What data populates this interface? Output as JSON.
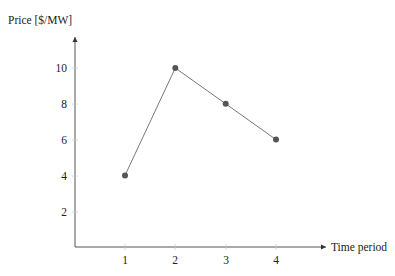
{
  "chart_data": {
    "type": "line",
    "title": "",
    "xlabel": "Time period",
    "ylabel": "Price [$/MW]",
    "x": [
      1,
      2,
      3,
      4
    ],
    "values": [
      4,
      10,
      8,
      6
    ],
    "series": [
      {
        "name": "Price",
        "x": [
          1,
          2,
          3,
          4
        ],
        "values": [
          4,
          10,
          8,
          6
        ],
        "color": "#555555",
        "marker": "filled-circle"
      }
    ],
    "x_ticks": [
      1,
      2,
      3,
      4
    ],
    "y_ticks": [
      2,
      4,
      6,
      8,
      10
    ],
    "xlim": [
      0,
      5
    ],
    "ylim": [
      0,
      11.5
    ],
    "grid": false,
    "legend": "none"
  },
  "labels": {
    "ylabel": "Price [$/MW]",
    "xlabel": "Time period",
    "x_ticks": [
      "1",
      "2",
      "3",
      "4"
    ],
    "y_ticks": [
      "2",
      "4",
      "6",
      "8",
      "10"
    ]
  }
}
